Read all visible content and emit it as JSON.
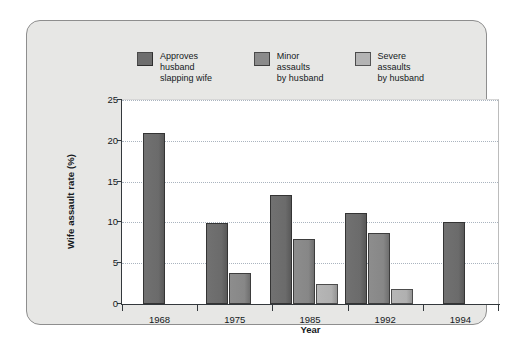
{
  "chart_data": {
    "type": "bar",
    "title": "",
    "xlabel": "Year",
    "ylabel": "Wife assault rate (%)",
    "categories": [
      "1968",
      "1975",
      "1985",
      "1992",
      "1994"
    ],
    "series": [
      {
        "name": "Approves husband slapping wife",
        "values": [
          21.0,
          9.9,
          13.3,
          11.1,
          10.1
        ],
        "color": "#6e6e6e"
      },
      {
        "name": "Minor assaults by husband",
        "values": [
          null,
          3.8,
          8.0,
          8.7,
          null
        ],
        "color": "#8b8b8b"
      },
      {
        "name": "Severe assaults by husband",
        "values": [
          null,
          null,
          2.4,
          1.9,
          null
        ],
        "color": "#b4b4b4"
      }
    ],
    "ylim": [
      0,
      25
    ],
    "yticks": [
      0,
      5,
      10,
      15,
      20,
      25
    ],
    "ytick_labels": [
      "0",
      "5",
      "10",
      "15",
      "20",
      "25"
    ],
    "grid": true,
    "grid_axis": "y",
    "grid_style": "dotted",
    "legend_position": "top-center",
    "bar_style": "grouped"
  },
  "legend": {
    "entries": [
      {
        "label": "Approves husband\nslapping wife"
      },
      {
        "label": "Minor assaults\nby husband"
      },
      {
        "label": "Severe assaults\nby husband"
      }
    ]
  },
  "axes": {
    "y_title": "Wife assault rate (%)",
    "x_title": "Year",
    "y_tick_labels": [
      "25",
      "20",
      "15",
      "10",
      "5",
      "0"
    ],
    "x_tick_labels": [
      "1968",
      "1975",
      "1985",
      "1992",
      "1994"
    ]
  },
  "colors": {
    "frame_fill": "#e7e7e5",
    "frame_border": "#8e8e8e",
    "plot_bg": "#ffffff",
    "grid": "#aab4bf",
    "axis": "#33383c",
    "series_1": "#6e6e6e",
    "series_2": "#8b8b8b",
    "series_3": "#b4b4b4"
  }
}
